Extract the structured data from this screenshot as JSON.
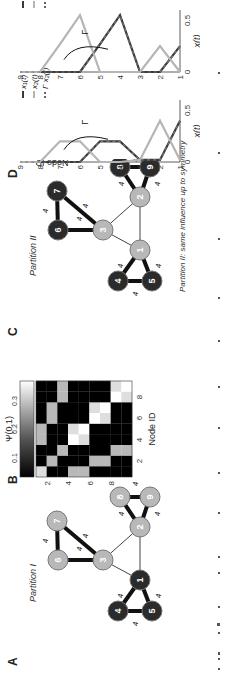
{
  "panels": {
    "A": {
      "letter": "A",
      "title": "Partition I",
      "edge_weight_label": "4",
      "nodes": [
        {
          "id": "1",
          "group": "dark"
        },
        {
          "id": "2",
          "group": "light"
        },
        {
          "id": "3",
          "group": "light"
        },
        {
          "id": "4",
          "group": "dark"
        },
        {
          "id": "5",
          "group": "dark"
        },
        {
          "id": "6",
          "group": "light"
        },
        {
          "id": "7",
          "group": "light"
        },
        {
          "id": "8",
          "group": "light"
        },
        {
          "id": "9",
          "group": "light"
        }
      ]
    },
    "B": {
      "letter": "B",
      "colorbar_label": "Ψ(0.1)",
      "colorbar_ticks": [
        "0.1",
        "0.2",
        "0.3"
      ],
      "xlabel": "Node ID",
      "ylabel": "Node ID",
      "ticks": [
        "2",
        "4",
        "6",
        "8"
      ]
    },
    "C": {
      "letter": "C",
      "title": "Partition II",
      "subtitle": "Partition II: same influence up to symmetry",
      "edge_weight_label": "4",
      "nodes": [
        {
          "id": "1",
          "group": "light"
        },
        {
          "id": "2",
          "group": "light"
        },
        {
          "id": "3",
          "group": "light"
        },
        {
          "id": "4",
          "group": "dark"
        },
        {
          "id": "5",
          "group": "dark"
        },
        {
          "id": "6",
          "group": "dark"
        },
        {
          "id": "7",
          "group": "dark"
        },
        {
          "id": "8",
          "group": "dark"
        },
        {
          "id": "9",
          "group": "dark"
        }
      ]
    },
    "D": {
      "letter": "D",
      "ylabel": "Node ID",
      "xlabel": "x(t)",
      "arrow_label": "Γ",
      "xticks": [
        "0",
        "0.5"
      ],
      "yticks": [
        "1",
        "2",
        "3",
        "4",
        "5",
        "6",
        "7",
        "8",
        "9"
      ],
      "left_legend": [
        "x₁(t)",
        "x₂(t)",
        "Γ x₂(t)"
      ],
      "right_legend": [
        "x₄(t)",
        "x₆(t)",
        "Γ x₆(t)"
      ]
    }
  },
  "colors": {
    "dark_node": "#2b2b2b",
    "light_node": "#b8b8b8",
    "edge": "#111111",
    "series_dark": "#3a3a3a",
    "series_light": "#b5b5b5"
  },
  "chart_data": [
    {
      "type": "heatmap",
      "title": "Ψ(0.1)",
      "xlabel": "Node ID",
      "ylabel": "Node ID",
      "x": [
        1,
        2,
        3,
        4,
        5,
        6,
        7,
        8,
        9
      ],
      "y": [
        1,
        2,
        3,
        4,
        5,
        6,
        7,
        8,
        9
      ],
      "colorbar_range": [
        0,
        0.35
      ],
      "values": [
        [
          0.28,
          0.0,
          0.0,
          0.2,
          0.2,
          0.0,
          0.0,
          0.0,
          0.0
        ],
        [
          0.0,
          0.2,
          0.0,
          0.0,
          0.0,
          0.2,
          0.2,
          0.0,
          0.0
        ],
        [
          0.0,
          0.0,
          0.2,
          0.0,
          0.0,
          0.0,
          0.0,
          0.2,
          0.2
        ],
        [
          0.2,
          0.0,
          0.0,
          0.35,
          0.28,
          0.0,
          0.0,
          0.0,
          0.0
        ],
        [
          0.2,
          0.0,
          0.0,
          0.28,
          0.35,
          0.0,
          0.0,
          0.0,
          0.0
        ],
        [
          0.0,
          0.2,
          0.0,
          0.0,
          0.0,
          0.35,
          0.28,
          0.0,
          0.0
        ],
        [
          0.0,
          0.2,
          0.0,
          0.0,
          0.0,
          0.28,
          0.35,
          0.0,
          0.0
        ],
        [
          0.0,
          0.0,
          0.2,
          0.0,
          0.0,
          0.0,
          0.0,
          0.35,
          0.28
        ],
        [
          0.0,
          0.0,
          0.2,
          0.0,
          0.0,
          0.0,
          0.0,
          0.28,
          0.35
        ]
      ]
    },
    {
      "type": "line",
      "title": "",
      "xlabel": "x(t)",
      "ylabel": "Node ID",
      "xlim": [
        0,
        0.6
      ],
      "y": [
        1,
        2,
        3,
        4,
        5,
        6,
        7,
        8,
        9
      ],
      "series": [
        {
          "name": "x1(t)",
          "values": [
            0.4,
            0.02,
            0.02,
            0.2,
            0.2,
            0.0,
            0.0,
            0.0,
            0.0
          ]
        },
        {
          "name": "x2(t)",
          "values": [
            0.02,
            0.4,
            0.02,
            0.0,
            0.0,
            0.2,
            0.2,
            0.0,
            0.0
          ]
        },
        {
          "name": "Γ x2(t)",
          "values": [
            0.4,
            0.02,
            0.02,
            0.2,
            0.2,
            0.0,
            0.0,
            0.0,
            0.0
          ]
        }
      ]
    },
    {
      "type": "line",
      "title": "",
      "xlabel": "x(t)",
      "ylabel": "Node ID",
      "xlim": [
        0,
        0.6
      ],
      "y": [
        1,
        2,
        3,
        4,
        5,
        6,
        7,
        8,
        9
      ],
      "series": [
        {
          "name": "x4(t)",
          "values": [
            0.25,
            0.0,
            0.0,
            0.55,
            0.27,
            0.0,
            0.0,
            0.0,
            0.0
          ]
        },
        {
          "name": "x6(t)",
          "values": [
            0.0,
            0.25,
            0.0,
            0.0,
            0.0,
            0.55,
            0.27,
            0.0,
            0.0
          ]
        },
        {
          "name": "Γ x6(t)",
          "values": [
            0.25,
            0.0,
            0.0,
            0.55,
            0.27,
            0.0,
            0.0,
            0.0,
            0.0
          ]
        }
      ]
    }
  ]
}
